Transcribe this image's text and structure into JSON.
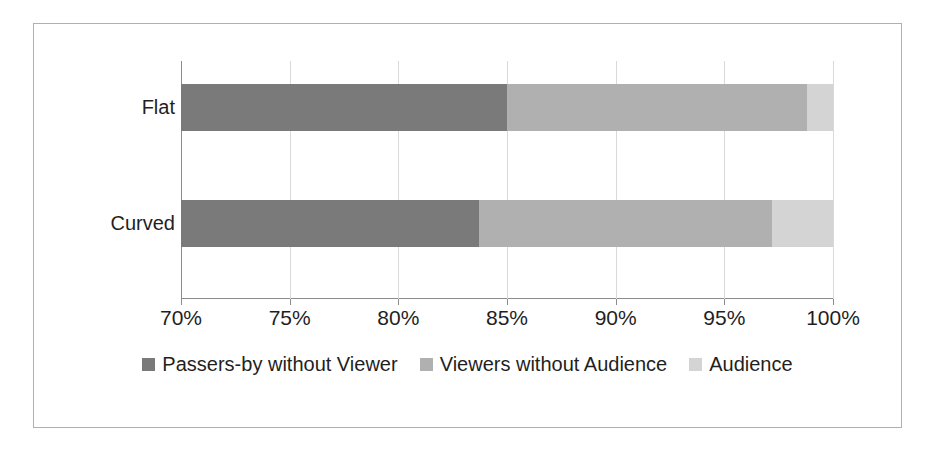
{
  "chart_data": {
    "type": "bar",
    "orientation": "horizontal",
    "stacked": true,
    "stack_mode": "percent",
    "title": "",
    "subtitle": "",
    "xlabel": "",
    "ylabel": "",
    "categories": [
      "Flat",
      "Curved"
    ],
    "xlim": [
      70,
      100
    ],
    "xticks": [
      70,
      75,
      80,
      85,
      90,
      95,
      100
    ],
    "xtick_labels": [
      "70%",
      "75%",
      "80%",
      "85%",
      "90%",
      "95%",
      "100%"
    ],
    "grid": true,
    "grid_axis": "x",
    "legend_position": "bottom",
    "series": [
      {
        "name": "Passers-by without Viewer",
        "color": "#7a7a7a",
        "values": [
          85.0,
          83.7
        ],
        "cumulative_end": [
          85.0,
          83.7
        ]
      },
      {
        "name": "Viewers without Audience",
        "color": "#b0b0b0",
        "values": [
          13.8,
          13.5
        ],
        "cumulative_end": [
          98.8,
          97.2
        ]
      },
      {
        "name": "Audience",
        "color": "#d4d4d4",
        "values": [
          1.2,
          2.8
        ],
        "cumulative_end": [
          100.0,
          100.0
        ]
      }
    ]
  },
  "legend": {
    "items": [
      {
        "label": "Passers-by without Viewer",
        "color": "#7a7a7a",
        "swatch_name": "legend-swatch-passers-by"
      },
      {
        "label": "Viewers without Audience",
        "color": "#b0b0b0",
        "swatch_name": "legend-swatch-viewers"
      },
      {
        "label": "Audience",
        "color": "#d4d4d4",
        "swatch_name": "legend-swatch-audience"
      }
    ]
  },
  "axis": {
    "tick_labels": [
      "70%",
      "75%",
      "80%",
      "85%",
      "90%",
      "95%",
      "100%"
    ],
    "category_labels": [
      "Flat",
      "Curved"
    ]
  },
  "colors": {
    "series_dark": "#7a7a7a",
    "series_mid": "#b0b0b0",
    "series_light": "#d4d4d4",
    "gridline": "#d9d9d9",
    "axis": "#8c8c8c",
    "frame_border": "#b0b0b0",
    "background": "#ffffff",
    "text": "#1f1f1f"
  }
}
